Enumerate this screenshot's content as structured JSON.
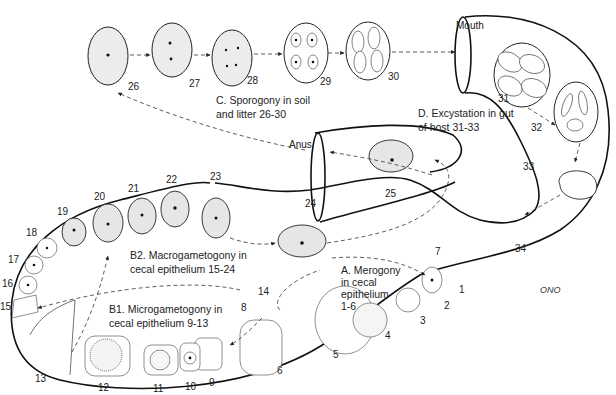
{
  "diagram": {
    "labels": {
      "mouth": "Mouth",
      "anus": "Anus",
      "signature": "ONO"
    },
    "stages": {
      "A": {
        "line1": "A. Merogony",
        "line2": "in cecal",
        "line3": "epithelium",
        "line4": "1-6"
      },
      "B1": {
        "line1": "B1. Microgametogony in",
        "line2": "cecal epithelium 9-13"
      },
      "B2": {
        "line1": "B2. Macrogametogony in",
        "line2": "cecal epithelium 15-24"
      },
      "C": {
        "line1": "C. Sporogony in soil",
        "line2": "and litter 26-30"
      },
      "D": {
        "line1": "D. Excystation in gut",
        "line2": "of host 31-33"
      }
    },
    "numbers": {
      "n1": "1",
      "n2": "2",
      "n3": "3",
      "n4": "4",
      "n5": "5",
      "n6": "6",
      "n7": "7",
      "n8": "8",
      "n9": "9",
      "n10": "10",
      "n11": "11",
      "n12": "12",
      "n13": "13",
      "n14": "14",
      "n15": "15",
      "n16": "16",
      "n17": "17",
      "n18": "18",
      "n19": "19",
      "n20": "20",
      "n21": "21",
      "n22": "22",
      "n23": "23",
      "n24": "24",
      "n25": "25",
      "n26": "26",
      "n27": "27",
      "n28": "28",
      "n29": "29",
      "n30": "30",
      "n31": "31",
      "n32": "32",
      "n33": "33",
      "n34": "34"
    }
  }
}
